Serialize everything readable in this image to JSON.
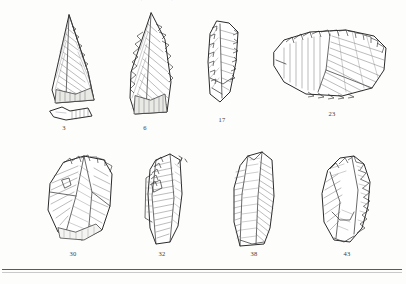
{
  "plate": {
    "caption_top": "cut-off caption line (illegible)",
    "background_color": "#fdfdfc",
    "ink_color": "#2b2b2b",
    "rule_color": "#5a5a5a"
  },
  "figures": [
    {
      "id": "fig-3",
      "number": "3",
      "row": 1,
      "description": "triangular Levallois point with separate basal fragment below"
    },
    {
      "id": "fig-6",
      "number": "6",
      "row": 1,
      "description": "large leaf-shaped point with heavily retouched left edge"
    },
    {
      "id": "fig-17",
      "number": "17",
      "row": 1,
      "description": "narrow elongated retouched flake"
    },
    {
      "id": "fig-23",
      "number": "23",
      "row": 1,
      "description": "wide fan-shaped side scraper with curved retouched edge"
    },
    {
      "id": "fig-30",
      "number": "30",
      "row": 2,
      "description": "broad blocky flake with prominent dorsal ridges"
    },
    {
      "id": "fig-32",
      "number": "32",
      "row": 2,
      "description": "elongated blade-like flake with rounded distal end and direction arrow"
    },
    {
      "id": "fig-38",
      "number": "38",
      "row": 2,
      "description": "elongated blade with strong central ridge"
    },
    {
      "id": "fig-43",
      "number": "43",
      "row": 2,
      "description": "irregular flake with heavy retouch along right edge"
    }
  ]
}
